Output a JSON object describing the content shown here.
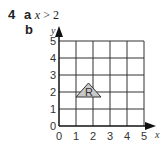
{
  "question": {
    "number": "4",
    "part_a": {
      "label": "a",
      "answer_var": "x",
      "answer_op": ">",
      "answer_val": "2"
    },
    "part_b": {
      "label": "b"
    }
  },
  "graph": {
    "x_axis_label": "x",
    "y_axis_label": "y",
    "x_ticks": [
      "0",
      "1",
      "2",
      "3",
      "4",
      "5"
    ],
    "y_ticks": [
      "0",
      "1",
      "2",
      "3",
      "4",
      "5"
    ],
    "region_label": "R",
    "region_vertices": [
      [
        1,
        2
      ],
      [
        2.5,
        2
      ],
      [
        1.75,
        2.5
      ]
    ],
    "region_fill": "#c8c8c8"
  }
}
